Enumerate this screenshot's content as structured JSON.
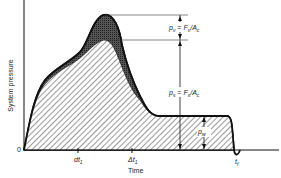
{
  "diagram": {
    "type": "pressure-time curve",
    "y_axis_label": "System pressure",
    "x_axis_label": "Time",
    "origin_label": "0",
    "x_ticks": [
      {
        "label": "dt",
        "sub": "1"
      },
      {
        "label": "Δt",
        "sub": "1"
      },
      {
        "label": "t",
        "sub": "f"
      }
    ],
    "annotations": {
      "pv": {
        "lhs": "p",
        "lhs_sub": "v",
        "rhs": "F",
        "rhs_sub": "v",
        "den": "A",
        "den_sub": "c"
      },
      "ps": {
        "lhs": "p",
        "lhs_sub": "s",
        "rhs": "F",
        "rhs_sub": "s",
        "den": "A",
        "den_sub": "c"
      },
      "pw": {
        "lhs": "p",
        "lhs_sub": "w"
      }
    },
    "regions": [
      {
        "name": "velocity-pressure-component",
        "fill": "dark stippled",
        "color": "#444444"
      },
      {
        "name": "static-pressure-component",
        "fill": "diagonal hatch",
        "color": "#333333"
      }
    ],
    "colors": {
      "line": "#111111",
      "hatch": "#333333",
      "dark": "#3a3a3a",
      "background": "#ffffff"
    }
  }
}
